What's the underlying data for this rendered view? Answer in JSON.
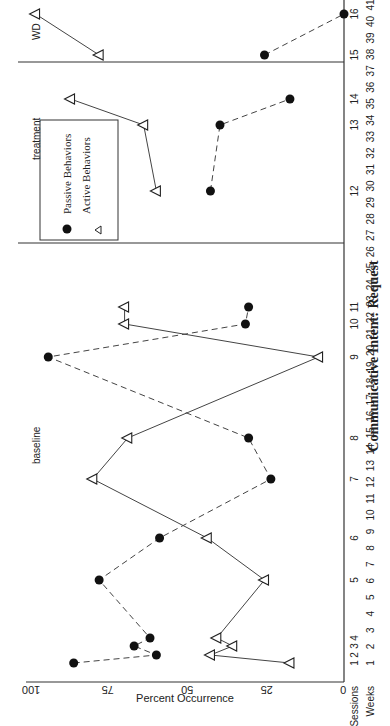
{
  "chart_data": {
    "type": "line",
    "title": "Communicative Intent:  Request",
    "xlabel": "Sessions / Weeks",
    "ylabel": "Percent Occurrence",
    "ylim": [
      0,
      100
    ],
    "yticks": [
      0,
      25,
      50,
      75,
      100
    ],
    "orientation": "rotated 90° counter-clockwise",
    "x_row_labels": {
      "sessions": "Sessions",
      "weeks": "Weeks"
    },
    "sessions": [
      1,
      2,
      3,
      4,
      5,
      6,
      7,
      8,
      9,
      10,
      11,
      12,
      13,
      14,
      15,
      16
    ],
    "weeks": [
      1,
      2,
      3,
      4,
      5,
      6,
      7,
      8,
      9,
      10,
      11,
      12,
      13,
      14,
      15,
      16,
      17,
      18,
      19,
      20,
      21,
      22,
      23,
      24,
      25,
      26,
      27,
      28,
      29,
      30,
      31,
      32,
      33,
      34,
      35,
      36,
      37,
      38,
      39,
      40,
      41
    ],
    "phases": [
      {
        "label": "baseline",
        "sessions": [
          1,
          11
        ]
      },
      {
        "label": "treatment",
        "sessions": [
          12,
          14
        ]
      },
      {
        "label": "WD",
        "sessions": [
          15,
          16
        ]
      }
    ],
    "series": [
      {
        "name": "Active Behaviors",
        "marker": "open-triangle",
        "line": "solid",
        "values": [
          17,
          42,
          35,
          40,
          25,
          43,
          79,
          68,
          8,
          69,
          69,
          59,
          63,
          86,
          77,
          97
        ]
      },
      {
        "name": "Passive Behaviors",
        "marker": "filled-circle",
        "line": "dashed",
        "values": [
          85,
          59,
          66,
          61,
          77,
          58,
          23,
          30,
          93,
          31,
          30,
          42,
          39,
          17,
          25,
          0
        ]
      }
    ],
    "legend": {
      "position": "inside, treatment phase",
      "entries": [
        "Active Behaviors",
        "Passive Behaviors"
      ]
    },
    "grid": false
  }
}
